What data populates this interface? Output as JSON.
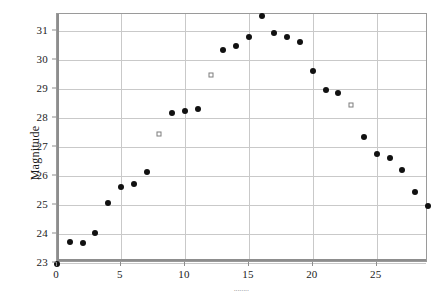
{
  "chart_data": {
    "type": "scatter",
    "title": "",
    "xlabel": "........",
    "ylabel": "Magnitude",
    "xlim": [
      0,
      29
    ],
    "ylim": [
      23,
      31.6
    ],
    "grid": true,
    "legend": null,
    "xticks": [
      0,
      5,
      10,
      15,
      20,
      25
    ],
    "yticks": [
      23,
      24,
      25,
      26,
      27,
      28,
      29,
      30,
      31
    ],
    "series": [
      {
        "name": "observed",
        "marker": "filled-circle",
        "color": "#111111",
        "points": [
          {
            "x": 0,
            "y": 22.97
          },
          {
            "x": 1,
            "y": 23.74
          },
          {
            "x": 2,
            "y": 23.69
          },
          {
            "x": 3,
            "y": 24.02
          },
          {
            "x": 4,
            "y": 25.07
          },
          {
            "x": 5,
            "y": 25.62
          },
          {
            "x": 6,
            "y": 25.72
          },
          {
            "x": 7,
            "y": 26.13
          },
          {
            "x": 9,
            "y": 28.19
          },
          {
            "x": 10,
            "y": 28.25
          },
          {
            "x": 11,
            "y": 28.31
          },
          {
            "x": 13,
            "y": 30.35
          },
          {
            "x": 14,
            "y": 30.48
          },
          {
            "x": 15,
            "y": 30.79
          },
          {
            "x": 16,
            "y": 31.53
          },
          {
            "x": 17,
            "y": 30.95
          },
          {
            "x": 18,
            "y": 30.82
          },
          {
            "x": 19,
            "y": 30.65
          },
          {
            "x": 20,
            "y": 29.64
          },
          {
            "x": 21,
            "y": 28.98
          },
          {
            "x": 22,
            "y": 28.86
          },
          {
            "x": 24,
            "y": 27.34
          },
          {
            "x": 25,
            "y": 26.78
          },
          {
            "x": 26,
            "y": 26.64
          },
          {
            "x": 27,
            "y": 26.2
          },
          {
            "x": 28,
            "y": 25.46
          },
          {
            "x": 29,
            "y": 24.97
          }
        ]
      },
      {
        "name": "alternate",
        "marker": "open-square",
        "color": "#7d7d7d",
        "points": [
          {
            "x": 8,
            "y": 27.44
          },
          {
            "x": 12,
            "y": 29.5
          },
          {
            "x": 23,
            "y": 28.45
          }
        ]
      }
    ]
  }
}
